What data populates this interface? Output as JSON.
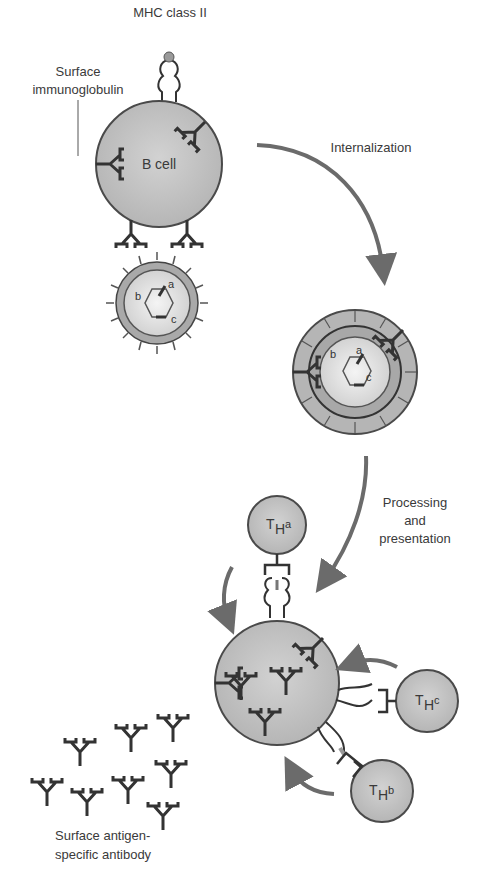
{
  "figure": {
    "labels": {
      "mhc": "MHC class II",
      "surface_ig_line1": "Surface",
      "surface_ig_line2": "immunoglobulin",
      "b_cell": "B cell",
      "internalization": "Internalization",
      "processing_line1": "Processing",
      "processing_line2": "and",
      "processing_line3": "presentation",
      "antibody_line1": "Surface antigen-",
      "antibody_line2": "specific antibody"
    },
    "antigen_epitopes": [
      "a",
      "b",
      "c"
    ],
    "t_helper_cells": [
      {
        "main": "T",
        "sub": "H",
        "suffix": "a"
      },
      {
        "main": "T",
        "sub": "H",
        "suffix": "c"
      },
      {
        "main": "T",
        "sub": "H",
        "suffix": "b"
      }
    ],
    "colors": {
      "cell_fill": "#bdbdbd",
      "cell_stroke": "#4a4a4a",
      "arrow": "#6b6b6b",
      "line": "#333333"
    }
  }
}
